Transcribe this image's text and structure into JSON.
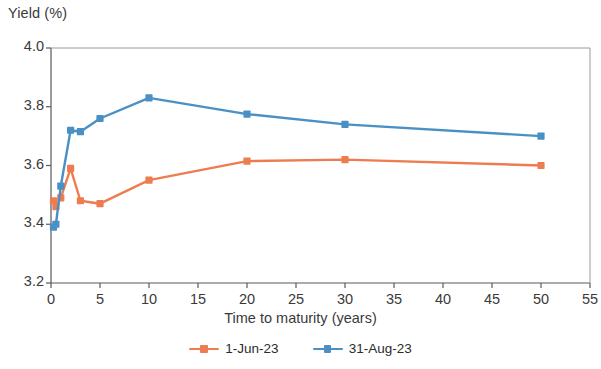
{
  "chart_data": {
    "type": "line",
    "title": "",
    "ylabel": "Yield (%)",
    "xlabel": "Time to maturity (years)",
    "xlim": [
      0,
      55
    ],
    "ylim": [
      3.2,
      4.0
    ],
    "xticks": [
      "0",
      "5",
      "10",
      "15",
      "20",
      "25",
      "30",
      "35",
      "40",
      "45",
      "50",
      "55"
    ],
    "xtick_values": [
      0,
      5,
      10,
      15,
      20,
      25,
      30,
      35,
      40,
      45,
      50,
      55
    ],
    "yticks": [
      "3.2",
      "3.4",
      "3.6",
      "3.8",
      "4.0"
    ],
    "ytick_values": [
      3.2,
      3.4,
      3.6,
      3.8,
      4.0
    ],
    "grid": false,
    "legend_position": "bottom",
    "x": [
      0.25,
      0.5,
      1,
      2,
      3,
      5,
      10,
      20,
      30,
      50
    ],
    "series": [
      {
        "name": "1-Jun-23",
        "color": "#ED7D51",
        "values": [
          3.48,
          3.46,
          3.49,
          3.59,
          3.48,
          3.47,
          3.55,
          3.615,
          3.62,
          3.6
        ]
      },
      {
        "name": "31-Aug-23",
        "color": "#4A90C4",
        "values": [
          3.39,
          3.4,
          3.53,
          3.72,
          3.715,
          3.76,
          3.83,
          3.775,
          3.74,
          3.7
        ]
      }
    ]
  },
  "legend": {
    "items": [
      {
        "label": "1-Jun-23",
        "color": "#ED7D51"
      },
      {
        "label": "31-Aug-23",
        "color": "#4A90C4"
      }
    ]
  },
  "axes": {
    "y_title": "Yield (%)",
    "x_title": "Time to maturity (years)"
  }
}
